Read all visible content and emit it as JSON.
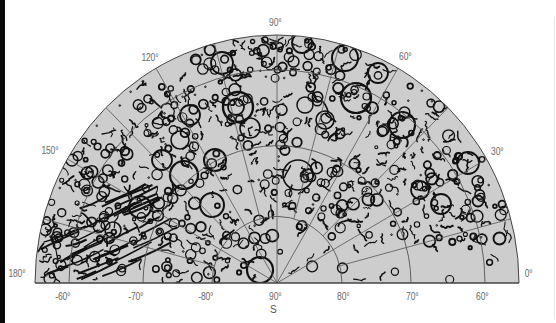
{
  "map": {
    "title": "Polar relief map (southern hemisphere, crater chart)",
    "fill_color": "#cdcdcd",
    "ink_color": "#111111",
    "grid_color": "#555555",
    "pole_label": "S",
    "longitude_labels": [
      {
        "text": "0°",
        "x": 524,
        "y": 268
      },
      {
        "text": "30°",
        "x": 490,
        "y": 146
      },
      {
        "text": "60°",
        "x": 398,
        "y": 51
      },
      {
        "text": "90°",
        "x": 268,
        "y": 17
      },
      {
        "text": "120°",
        "x": 140,
        "y": 52
      },
      {
        "text": "150°",
        "x": 40,
        "y": 145
      },
      {
        "text": "180°",
        "x": 7,
        "y": 268
      }
    ],
    "latitude_labels": [
      {
        "text": "-60°",
        "x": 54,
        "y": 291
      },
      {
        "text": "-70°",
        "x": 127,
        "y": 291
      },
      {
        "text": "-80°",
        "x": 197,
        "y": 291
      },
      {
        "text": "90°",
        "x": 268,
        "y": 291
      },
      {
        "text": "80°",
        "x": 336,
        "y": 291
      },
      {
        "text": "70°",
        "x": 405,
        "y": 291
      },
      {
        "text": "60°",
        "x": 475,
        "y": 291
      }
    ],
    "pole_label_pos": {
      "x": 270,
      "y": 304
    }
  }
}
